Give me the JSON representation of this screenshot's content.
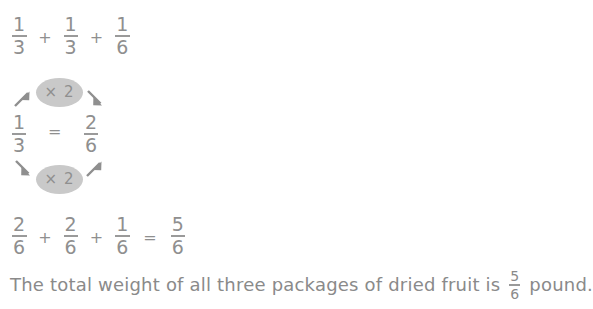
{
  "page": {
    "background_color": "#ffffff",
    "ink_color": "#8f8f8f",
    "accent_color": "#c9c9c9"
  },
  "equation_top": {
    "terms": [
      {
        "numerator": "1",
        "denominator": "3"
      },
      {
        "numerator": "1",
        "denominator": "3"
      },
      {
        "numerator": "1",
        "denominator": "6"
      }
    ],
    "operator": "+"
  },
  "conversion_diagram": {
    "multiplier_top_label": "× 2",
    "multiplier_bottom_label": "× 2",
    "equals_sign": "=",
    "left_fraction": {
      "numerator": "1",
      "denominator": "3"
    },
    "right_fraction": {
      "numerator": "2",
      "denominator": "6"
    },
    "arrows": [
      {
        "name": "arrow-top-left",
        "direction": "up-right"
      },
      {
        "name": "arrow-top-right",
        "direction": "down-right"
      },
      {
        "name": "arrow-bottom-left",
        "direction": "down-right"
      },
      {
        "name": "arrow-bottom-right",
        "direction": "up-right"
      }
    ]
  },
  "equation_bottom": {
    "terms": [
      {
        "numerator": "2",
        "denominator": "6"
      },
      {
        "numerator": "2",
        "denominator": "6"
      },
      {
        "numerator": "1",
        "denominator": "6"
      }
    ],
    "operator": "+",
    "equals_sign": "=",
    "result": {
      "numerator": "5",
      "denominator": "6"
    }
  },
  "answer_sentence": {
    "text_before": "The total weight of all three packages of dried fruit is",
    "fraction": {
      "numerator": "5",
      "denominator": "6"
    },
    "text_after": "pound."
  }
}
